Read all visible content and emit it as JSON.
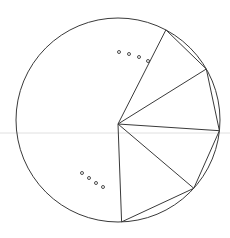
{
  "diagram": {
    "title": "",
    "vertex_count_shown": 5,
    "vertex_angles_deg": [
      -62,
      -30,
      6,
      42,
      88
    ],
    "ellipsis_groups": [
      {
        "name": "upper-ellipsis",
        "dots": 4
      },
      {
        "name": "lower-ellipsis",
        "dots": 4
      }
    ],
    "colors": {
      "stroke": "#3a3a3a",
      "guide_line": "#d8d8d8",
      "background": "#ffffff"
    }
  }
}
